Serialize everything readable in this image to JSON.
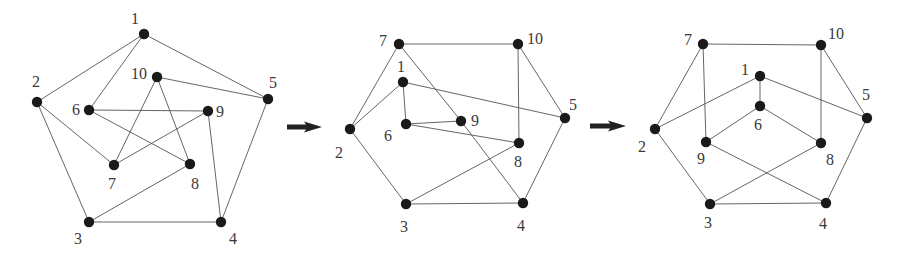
{
  "figure": {
    "colors": {
      "node": "#1a1a1a",
      "edge": "#555555",
      "label": "#3a3a3a",
      "arrow": "#222222"
    },
    "node_radius": 5.2,
    "graphs": [
      {
        "id": "graph-1",
        "nodes": [
          {
            "id": "1",
            "x": 144,
            "y": 34,
            "lx": 131,
            "ly": 24
          },
          {
            "id": "2",
            "x": 37,
            "y": 102,
            "lx": 32,
            "ly": 87
          },
          {
            "id": "3",
            "x": 89,
            "y": 222,
            "lx": 74,
            "ly": 244
          },
          {
            "id": "4",
            "x": 221,
            "y": 222,
            "lx": 229,
            "ly": 244
          },
          {
            "id": "5",
            "x": 268,
            "y": 99,
            "lx": 269,
            "ly": 88
          },
          {
            "id": "6",
            "x": 89,
            "y": 110,
            "lx": 72,
            "ly": 115
          },
          {
            "id": "7",
            "x": 114,
            "y": 165,
            "lx": 108,
            "ly": 189
          },
          {
            "id": "8",
            "x": 190,
            "y": 164,
            "lx": 191,
            "ly": 189
          },
          {
            "id": "9",
            "x": 208,
            "y": 111,
            "lx": 216,
            "ly": 117
          },
          {
            "id": "10",
            "x": 157,
            "y": 77,
            "lx": 131,
            "ly": 79
          }
        ],
        "edges": [
          [
            "1",
            "2"
          ],
          [
            "1",
            "5"
          ],
          [
            "1",
            "6"
          ],
          [
            "2",
            "3"
          ],
          [
            "2",
            "7"
          ],
          [
            "3",
            "4"
          ],
          [
            "3",
            "8"
          ],
          [
            "4",
            "5"
          ],
          [
            "4",
            "9"
          ],
          [
            "5",
            "10"
          ],
          [
            "6",
            "9"
          ],
          [
            "6",
            "8"
          ],
          [
            "7",
            "10"
          ],
          [
            "7",
            "9"
          ],
          [
            "8",
            "10"
          ]
        ]
      },
      {
        "id": "graph-2",
        "nodes": [
          {
            "id": "1",
            "x": 403,
            "y": 82,
            "lx": 397,
            "ly": 72
          },
          {
            "id": "2",
            "x": 350,
            "y": 129,
            "lx": 335,
            "ly": 158
          },
          {
            "id": "3",
            "x": 406,
            "y": 204,
            "lx": 400,
            "ly": 232
          },
          {
            "id": "4",
            "x": 523,
            "y": 203,
            "lx": 517,
            "ly": 231
          },
          {
            "id": "5",
            "x": 565,
            "y": 118,
            "lx": 569,
            "ly": 110
          },
          {
            "id": "6",
            "x": 406,
            "y": 124,
            "lx": 384,
            "ly": 141
          },
          {
            "id": "7",
            "x": 399,
            "y": 44,
            "lx": 379,
            "ly": 46
          },
          {
            "id": "8",
            "x": 519,
            "y": 143,
            "lx": 514,
            "ly": 167
          },
          {
            "id": "9",
            "x": 461,
            "y": 121,
            "lx": 471,
            "ly": 126
          },
          {
            "id": "10",
            "x": 518,
            "y": 44,
            "lx": 527,
            "ly": 44
          }
        ],
        "edges": [
          [
            "7",
            "10"
          ],
          [
            "7",
            "2"
          ],
          [
            "7",
            "9"
          ],
          [
            "9",
            "4"
          ],
          [
            "1",
            "2"
          ],
          [
            "1",
            "6"
          ],
          [
            "1",
            "5"
          ],
          [
            "6",
            "9"
          ],
          [
            "6",
            "8"
          ],
          [
            "10",
            "8"
          ],
          [
            "10",
            "5"
          ],
          [
            "5",
            "4"
          ],
          [
            "2",
            "3"
          ],
          [
            "3",
            "4"
          ],
          [
            "3",
            "8"
          ]
        ]
      },
      {
        "id": "graph-3",
        "nodes": [
          {
            "id": "1",
            "x": 760,
            "y": 76,
            "lx": 741,
            "ly": 75
          },
          {
            "id": "2",
            "x": 655,
            "y": 129,
            "lx": 638,
            "ly": 152
          },
          {
            "id": "3",
            "x": 710,
            "y": 204,
            "lx": 704,
            "ly": 228
          },
          {
            "id": "4",
            "x": 826,
            "y": 203,
            "lx": 819,
            "ly": 229
          },
          {
            "id": "5",
            "x": 867,
            "y": 118,
            "lx": 862,
            "ly": 100
          },
          {
            "id": "6",
            "x": 760,
            "y": 106,
            "lx": 754,
            "ly": 130
          },
          {
            "id": "7",
            "x": 703,
            "y": 44,
            "lx": 684,
            "ly": 45
          },
          {
            "id": "8",
            "x": 821,
            "y": 143,
            "lx": 826,
            "ly": 165
          },
          {
            "id": "9",
            "x": 706,
            "y": 142,
            "lx": 697,
            "ly": 164
          },
          {
            "id": "10",
            "x": 821,
            "y": 45,
            "lx": 828,
            "ly": 39
          }
        ],
        "edges": [
          [
            "7",
            "10"
          ],
          [
            "7",
            "2"
          ],
          [
            "7",
            "9"
          ],
          [
            "1",
            "6"
          ],
          [
            "1",
            "2"
          ],
          [
            "1",
            "5"
          ],
          [
            "6",
            "9"
          ],
          [
            "6",
            "8"
          ],
          [
            "10",
            "8"
          ],
          [
            "10",
            "5"
          ],
          [
            "5",
            "4"
          ],
          [
            "2",
            "3"
          ],
          [
            "3",
            "4"
          ],
          [
            "3",
            "8"
          ],
          [
            "9",
            "4"
          ]
        ]
      }
    ],
    "arrows": [
      {
        "id": "arrow-1",
        "x1": 287,
        "x2": 322,
        "y": 127
      },
      {
        "id": "arrow-2",
        "x1": 590,
        "x2": 626,
        "y": 126
      }
    ]
  }
}
